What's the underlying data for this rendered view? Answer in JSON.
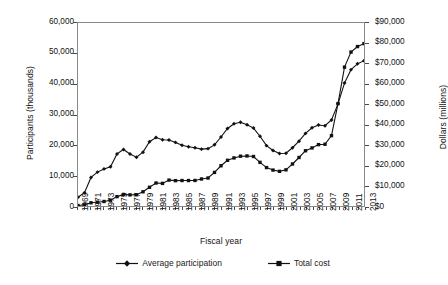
{
  "chart_data": {
    "type": "line",
    "title": "",
    "xlabel": "Fiscal year",
    "ylabel": "Participants (thousands)",
    "y2label": "Dollars (millions)",
    "grid": false,
    "legend_position": "bottom",
    "xlim": [
      1969,
      2013
    ],
    "ylim": [
      0,
      60000
    ],
    "y2lim": [
      0,
      90000
    ],
    "x": [
      1969,
      1970,
      1971,
      1972,
      1973,
      1974,
      1975,
      1976,
      1977,
      1978,
      1979,
      1980,
      1981,
      1982,
      1983,
      1984,
      1985,
      1986,
      1987,
      1988,
      1989,
      1990,
      1991,
      1992,
      1993,
      1994,
      1995,
      1996,
      1997,
      1998,
      1999,
      2000,
      2001,
      2002,
      2003,
      2004,
      2005,
      2006,
      2007,
      2008,
      2009,
      2010,
      2011,
      2012,
      2013
    ],
    "xtick_labels": [
      "1969",
      "1971",
      "1973",
      "1975",
      "1977",
      "1979",
      "1981",
      "1983",
      "1985",
      "1987",
      "1989",
      "1991",
      "1993",
      "1995",
      "1997",
      "1999",
      "2001",
      "2003",
      "2005",
      "2007",
      "2009",
      "2011",
      "2013"
    ],
    "ytick_labels": [
      "0",
      "10,000",
      "20,000",
      "30,000",
      "40,000",
      "50,000",
      "60,000"
    ],
    "ytick_values": [
      0,
      10000,
      20000,
      30000,
      40000,
      50000,
      60000
    ],
    "y2tick_labels": [
      "$0",
      "$10,000",
      "$20,000",
      "$30,000",
      "$40,000",
      "$50,000",
      "$60,000",
      "$70,000",
      "$80,000",
      "$90,000"
    ],
    "y2tick_values": [
      0,
      10000,
      20000,
      30000,
      40000,
      50000,
      60000,
      70000,
      80000,
      90000
    ],
    "series": [
      {
        "name": "Average participation",
        "axis": "left",
        "marker": "diamond",
        "units": "thousands of participants",
        "values": [
          2878,
          4340,
          9368,
          11109,
          12166,
          12862,
          17064,
          18549,
          17077,
          16001,
          17653,
          21082,
          22430,
          21717,
          21625,
          20854,
          19899,
          19429,
          19113,
          18645,
          18806,
          20049,
          22625,
          25407,
          26987,
          27474,
          26619,
          25543,
          22858,
          19791,
          18183,
          17194,
          17318,
          19096,
          21250,
          23811,
          25628,
          26549,
          26316,
          28223,
          33490,
          40302,
          44709,
          46609,
          47636
        ]
      },
      {
        "name": "Total cost",
        "axis": "right",
        "marker": "square",
        "units": "millions of dollars",
        "values": [
          250,
          577,
          1575,
          1866,
          2212,
          2838,
          4619,
          5692,
          5469,
          5527,
          6984,
          9210,
          11308,
          11117,
          12734,
          12470,
          12529,
          12529,
          12568,
          13288,
          13762,
          16512,
          19791,
          22469,
          23653,
          24493,
          24620,
          24345,
          21464,
          18894,
          17671,
          17054,
          17792,
          20657,
          23853,
          27177,
          28568,
          30187,
          30373,
          34608,
          50360,
          68284,
          75701,
          78411,
          79859
        ]
      }
    ]
  },
  "legend": {
    "items": [
      {
        "label": "Average participation",
        "marker": "diamond-marker"
      },
      {
        "label": "Total cost",
        "marker": "square-marker"
      }
    ]
  },
  "colors": {
    "series": "#111111",
    "axis": "#8a8a8a",
    "text": "#1a1a1a"
  }
}
